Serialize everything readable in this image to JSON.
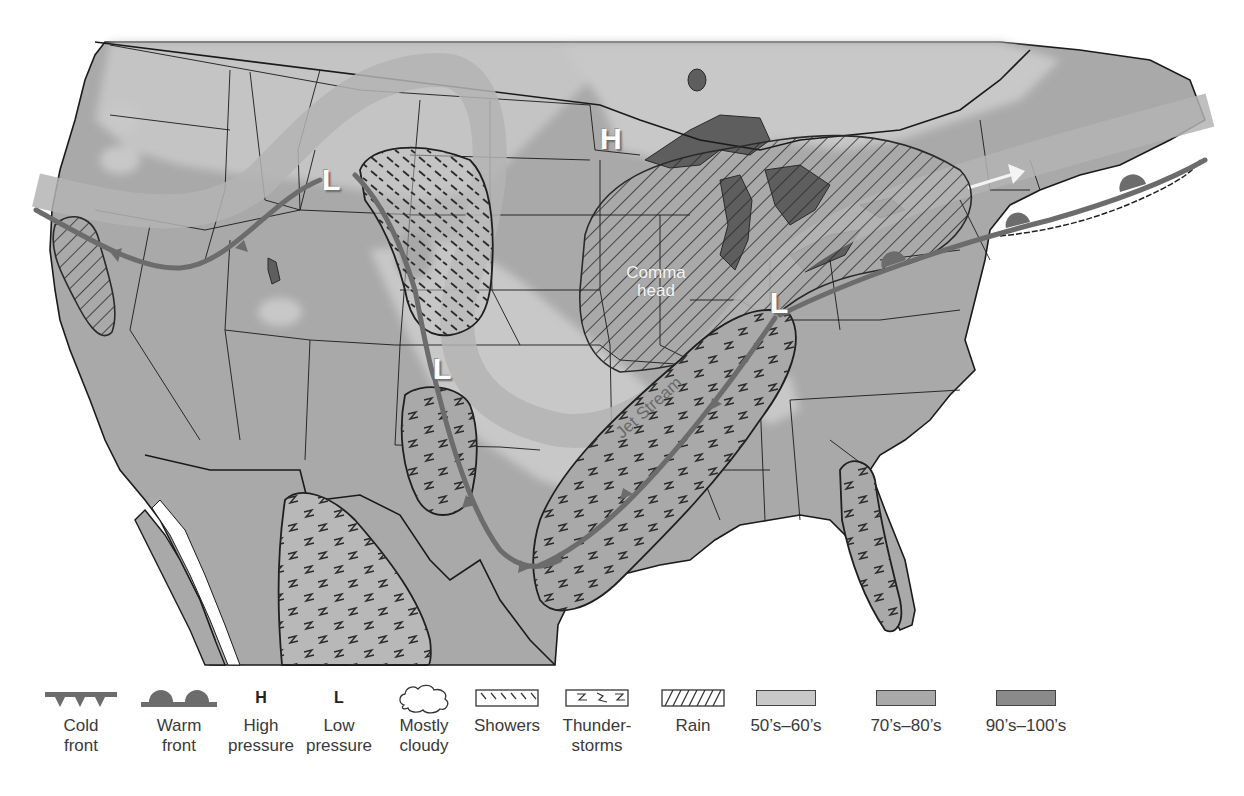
{
  "map": {
    "title": "United States weather map",
    "labels": {
      "high_pressure": "H",
      "low_pressure_1": "L",
      "low_pressure_2": "L",
      "low_pressure_3": "L",
      "comma_head_line1": "Comma",
      "comma_head_line2": "head",
      "jet_stream": "Jet Stream"
    },
    "features": [
      {
        "type": "high-pressure",
        "label": "H",
        "location": "Minnesota / Lake Superior"
      },
      {
        "type": "low-pressure",
        "label": "L",
        "location": "Montana / Wyoming"
      },
      {
        "type": "low-pressure",
        "label": "L",
        "location": "Colorado / New Mexico border"
      },
      {
        "type": "low-pressure",
        "label": "L",
        "location": "Ohio Valley"
      },
      {
        "type": "cold-front",
        "location": "Pacific Northwest to northern California"
      },
      {
        "type": "cold-front",
        "location": "Colorado Rockies to Texas Gulf Coast"
      },
      {
        "type": "cold-front",
        "location": "Texas Gulf Coast to Ohio Valley"
      },
      {
        "type": "warm-front",
        "location": "Ohio Valley to New England and Atlantic"
      },
      {
        "type": "jet-stream",
        "location": "Pacific Northwest, looping through Rockies, northeast to Atlantic"
      },
      {
        "type": "showers",
        "location": "Wyoming / Colorado"
      },
      {
        "type": "thunderstorms",
        "location": "New Mexico, Texas/Mexico, Mississippi Valley, Florida"
      },
      {
        "type": "rain",
        "location": "northern California, Great Lakes (comma head)"
      }
    ],
    "colors": {
      "ocean": "#ffffff",
      "temp_50s_60s": "#c8c8c8",
      "temp_70s_80s": "#a8a8a8",
      "temp_90s_100s": "#8a8a8a",
      "lakes": "#5e5e5e",
      "front_line": "#6c6c6c",
      "jet_stream_band": "#b4b4b4",
      "borders": "#1a1a1a"
    }
  },
  "legend": {
    "items": [
      {
        "id": "cold-front",
        "line1": "Cold",
        "line2": "front"
      },
      {
        "id": "warm-front",
        "line1": "Warm",
        "line2": "front"
      },
      {
        "id": "high-pressure",
        "symbol": "H",
        "line1": "High",
        "line2": "pressure"
      },
      {
        "id": "low-pressure",
        "symbol": "L",
        "line1": "Low",
        "line2": "pressure"
      },
      {
        "id": "mostly-cloudy",
        "line1": "Mostly",
        "line2": "cloudy"
      },
      {
        "id": "showers",
        "line1": "Showers",
        "line2": ""
      },
      {
        "id": "thunderstorms",
        "line1": "Thunder-",
        "line2": "storms"
      },
      {
        "id": "rain",
        "line1": "Rain",
        "line2": ""
      },
      {
        "id": "temp-50s-60s",
        "line1": "50’s–60’s",
        "line2": ""
      },
      {
        "id": "temp-70s-80s",
        "line1": "70’s–80’s",
        "line2": ""
      },
      {
        "id": "temp-90s-100s",
        "line1": "90’s–100’s",
        "line2": ""
      }
    ]
  }
}
